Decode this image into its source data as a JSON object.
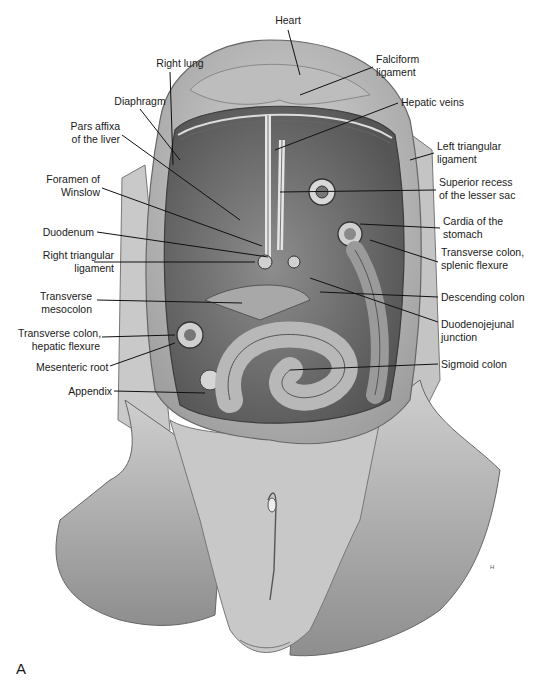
{
  "figure": {
    "panel_letter": "A",
    "signature": "H",
    "labels": [
      {
        "id": "heart",
        "text": "Heart",
        "x": 258,
        "y": 14,
        "align": "c",
        "w": 60,
        "line": [
          288,
          30,
          300,
          75
        ]
      },
      {
        "id": "right-lung",
        "text": "Right lung",
        "x": 140,
        "y": 57,
        "align": "c",
        "w": 80,
        "line": [
          170,
          72,
          173,
          165
        ]
      },
      {
        "id": "falciform-ligament",
        "text": "Falciform\nligament",
        "x": 376,
        "y": 53,
        "align": "l",
        "w": 80,
        "line": [
          373,
          67,
          300,
          95
        ]
      },
      {
        "id": "diaphragm",
        "text": "Diaphragm",
        "x": 100,
        "y": 95,
        "align": "c",
        "w": 80,
        "line": [
          140,
          109,
          180,
          160
        ]
      },
      {
        "id": "hepatic-veins",
        "text": "Hepatic veins",
        "x": 401,
        "y": 96,
        "align": "l",
        "w": 100,
        "line": [
          398,
          103,
          275,
          150
        ]
      },
      {
        "id": "pars-affixa",
        "text": "Pars affixa\nof the liver",
        "x": 44,
        "y": 120,
        "align": "r",
        "w": 76,
        "line": [
          122,
          135,
          240,
          220
        ]
      },
      {
        "id": "left-triangular-ligament",
        "text": "Left triangular\nligament",
        "x": 437,
        "y": 140,
        "align": "l",
        "w": 100,
        "line": [
          434,
          153,
          410,
          160
        ]
      },
      {
        "id": "foramen-of-winslow",
        "text": "Foramen of\nWinslow",
        "x": 22,
        "y": 173,
        "align": "r",
        "w": 78,
        "line": [
          102,
          188,
          262,
          246
        ]
      },
      {
        "id": "superior-recess",
        "text": "Superior recess\nof the lesser sac",
        "x": 439,
        "y": 176,
        "align": "l",
        "w": 103,
        "line": [
          436,
          190,
          280,
          192
        ]
      },
      {
        "id": "cardia",
        "text": "Cardia of the\nstomach",
        "x": 443,
        "y": 215,
        "align": "l",
        "w": 99,
        "line": [
          440,
          228,
          360,
          224
        ]
      },
      {
        "id": "duodenum",
        "text": "Duodenum",
        "x": 42,
        "y": 226,
        "align": "r",
        "w": 52,
        "line": [
          97,
          232,
          268,
          257
        ]
      },
      {
        "id": "transverse-colon-splenic",
        "text": "Transverse colon,\nsplenic flexure",
        "x": 441,
        "y": 246,
        "align": "l",
        "w": 101,
        "line": [
          438,
          262,
          370,
          240
        ]
      },
      {
        "id": "right-triangular-ligament",
        "text": "Right triangular\nligament",
        "x": 22,
        "y": 249,
        "align": "r",
        "w": 92,
        "line": [
          94,
          262,
          255,
          262
        ]
      },
      {
        "id": "descending-colon",
        "text": "Descending colon",
        "x": 441,
        "y": 291,
        "align": "l",
        "w": 101,
        "line": [
          438,
          297,
          320,
          292
        ]
      },
      {
        "id": "transverse-mesocolon",
        "text": "Transverse\nmesocolon",
        "x": 40,
        "y": 290,
        "align": "r",
        "w": 52,
        "line": [
          97,
          300,
          242,
          303
        ]
      },
      {
        "id": "duodenojejunal-junction",
        "text": "Duodenojejunal\njunction",
        "x": 441,
        "y": 318,
        "align": "l",
        "w": 101,
        "line": [
          438,
          322,
          310,
          278
        ]
      },
      {
        "id": "transverse-colon-hepatic",
        "text": "Transverse colon,\nhepatic flexure",
        "x": 18,
        "y": 327,
        "align": "r",
        "w": 82,
        "line": [
          102,
          337,
          175,
          335
        ]
      },
      {
        "id": "mesenteric-root",
        "text": "Mesenteric root",
        "x": 36,
        "y": 361,
        "align": "r",
        "w": 72,
        "line": [
          110,
          366,
          175,
          343
        ]
      },
      {
        "id": "sigmoid-colon",
        "text": "Sigmoid colon",
        "x": 441,
        "y": 358,
        "align": "l",
        "w": 101,
        "line": [
          438,
          364,
          290,
          370
        ]
      },
      {
        "id": "appendix",
        "text": "Appendix",
        "x": 68,
        "y": 385,
        "align": "r",
        "w": 44,
        "line": [
          114,
          391,
          205,
          393
        ]
      }
    ]
  }
}
